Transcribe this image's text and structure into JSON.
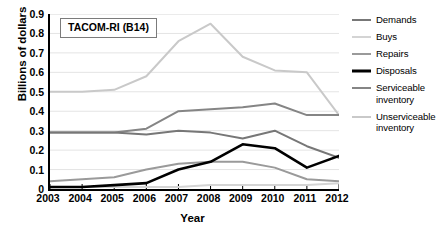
{
  "chart_data": {
    "type": "line",
    "title": "TACOM-RI (B14)",
    "xlabel": "Year",
    "ylabel": "Billions of dollars",
    "x": [
      2003,
      2004,
      2005,
      2006,
      2007,
      2008,
      2009,
      2010,
      2011,
      2012
    ],
    "xtick_labels": [
      "2003",
      "2004",
      "2005",
      "2006",
      "2007",
      "2008",
      "2009",
      "2010",
      "2011",
      "2012"
    ],
    "ytick_labels": [
      "0",
      "0.1",
      "0.2",
      "0.3",
      "0.4",
      "0.5",
      "0.6",
      "0.7",
      "0.8",
      "0.9"
    ],
    "ytick_values": [
      0,
      0.1,
      0.2,
      0.3,
      0.4,
      0.5,
      0.6,
      0.7,
      0.8,
      0.9
    ],
    "ylim": [
      0,
      0.9
    ],
    "xlim": [
      2003,
      2012
    ],
    "grid": "horizontal",
    "legend_position": "right",
    "series": [
      {
        "name": "Demands",
        "color": "#777777",
        "width": 2.0,
        "values": [
          0.29,
          0.29,
          0.29,
          0.28,
          0.3,
          0.29,
          0.26,
          0.3,
          0.22,
          0.16
        ]
      },
      {
        "name": "Buys",
        "color": "#d4d4d4",
        "width": 2.0,
        "values": [
          0.01,
          0.01,
          0.01,
          0.01,
          0.01,
          0.02,
          0.02,
          0.02,
          0.02,
          0.03
        ]
      },
      {
        "name": "Repairs",
        "color": "#9a9a9a",
        "width": 2.0,
        "values": [
          0.04,
          0.05,
          0.06,
          0.1,
          0.13,
          0.14,
          0.14,
          0.11,
          0.05,
          0.04
        ]
      },
      {
        "name": "Disposals",
        "color": "#000000",
        "width": 2.6,
        "values": [
          0.01,
          0.01,
          0.02,
          0.03,
          0.1,
          0.14,
          0.23,
          0.21,
          0.11,
          0.17
        ]
      },
      {
        "name": "Serviceable inventory",
        "color": "#858585",
        "width": 2.0,
        "values": [
          0.29,
          0.29,
          0.29,
          0.31,
          0.4,
          0.41,
          0.42,
          0.44,
          0.38,
          0.38
        ]
      },
      {
        "name": "Unserviceable inventory",
        "color": "#c9c9c9",
        "width": 2.0,
        "values": [
          0.5,
          0.5,
          0.51,
          0.58,
          0.76,
          0.85,
          0.68,
          0.61,
          0.6,
          0.38
        ]
      }
    ]
  },
  "legend": {
    "items": [
      {
        "label": "Demands"
      },
      {
        "label": "Buys"
      },
      {
        "label": "Repairs"
      },
      {
        "label": "Disposals"
      },
      {
        "label": "Serviceable inventory"
      },
      {
        "label": "Unserviceable inventory"
      }
    ]
  },
  "colors": {
    "axis": "#000000",
    "grid": "#e4e4e4",
    "background": "#ffffff",
    "box_border": "#7b7b7b"
  }
}
